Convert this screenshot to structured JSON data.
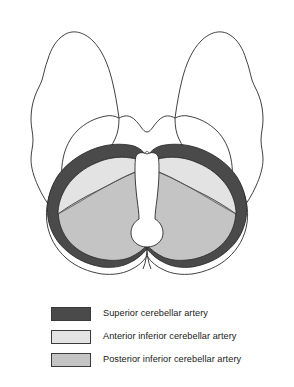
{
  "figure": {
    "view": "Axial inferior view of brain showing cerebellar arterial supply territories"
  },
  "colors": {
    "superior_cerebellar_artery": "#4a4a4a",
    "anterior_inferior_cerebellar_artery": "#e3e3e3",
    "posterior_inferior_cerebellar_artery": "#c4c4c4",
    "outline": "#2b2b2b",
    "background": "#ffffff",
    "brainstem_fill": "#ffffff"
  },
  "anatomy": {
    "regions": [
      {
        "name": "superior-cerebellar-artery-territory",
        "label": "Superior cerebellar artery territory",
        "shade": "dark"
      },
      {
        "name": "anterior-inferior-cerebellar-artery-territory",
        "label": "Anterior inferior cerebellar artery territory",
        "shade": "light"
      },
      {
        "name": "posterior-inferior-cerebellar-artery-territory",
        "label": "Posterior inferior cerebellar artery territory",
        "shade": "medium"
      }
    ],
    "structures": [
      {
        "name": "left-temporal-lobe",
        "label": "Left temporal lobe"
      },
      {
        "name": "right-temporal-lobe",
        "label": "Right temporal lobe"
      },
      {
        "name": "midbrain",
        "label": "Midbrain"
      },
      {
        "name": "brainstem",
        "label": "Brainstem"
      },
      {
        "name": "cerebellum",
        "label": "Cerebellum"
      }
    ]
  },
  "legend": {
    "items": [
      {
        "label": "Superior cerebellar artery",
        "color": "#4a4a4a",
        "key": "sca"
      },
      {
        "label": "Anterior inferior cerebellar artery",
        "color": "#e3e3e3",
        "key": "aica"
      },
      {
        "label": "Posterior inferior cerebellar artery",
        "color": "#c4c4c4",
        "key": "pica"
      }
    ]
  }
}
